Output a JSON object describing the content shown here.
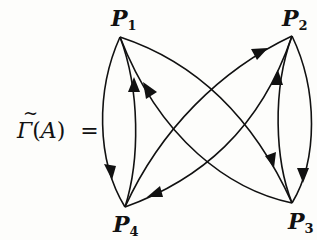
{
  "equation": {
    "lhs_symbol": "Γ",
    "lhs_accent": "~",
    "lhs_open": "(",
    "lhs_arg": "A",
    "lhs_close": ")",
    "equals": "="
  },
  "nodes": [
    {
      "id": "P1",
      "base": "P",
      "sub": "1",
      "x": 120,
      "y": 37
    },
    {
      "id": "P2",
      "base": "P",
      "sub": "2",
      "x": 292,
      "y": 36
    },
    {
      "id": "P3",
      "base": "P",
      "sub": "3",
      "x": 292,
      "y": 203
    },
    {
      "id": "P4",
      "base": "P",
      "sub": "4",
      "x": 125,
      "y": 207
    }
  ],
  "edges": [
    {
      "from": "P1",
      "to": "P4"
    },
    {
      "from": "P4",
      "to": "P1"
    },
    {
      "from": "P1",
      "to": "P3"
    },
    {
      "from": "P3",
      "to": "P1"
    },
    {
      "from": "P4",
      "to": "P2"
    },
    {
      "from": "P2",
      "to": "P4"
    },
    {
      "from": "P2",
      "to": "P3"
    },
    {
      "from": "P3",
      "to": "P2"
    }
  ]
}
